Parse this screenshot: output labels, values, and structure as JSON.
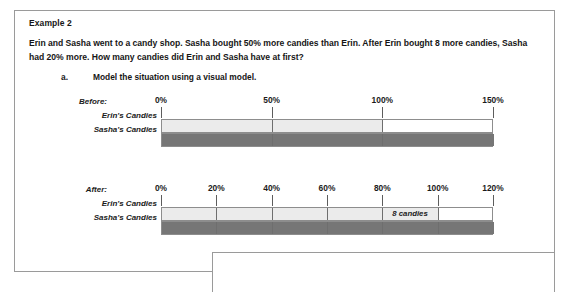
{
  "document": {
    "example_title": "Example 2",
    "problem_statement": "Erin and Sasha went to a candy shop.  Sasha bought 50% more candies than Erin.  After Erin bought 8 more candies, Sasha had 20% more.  How many candies did Erin and Sasha have at first?",
    "part_a": {
      "letter": "a.",
      "text": "Model the situation using a visual model."
    }
  },
  "colors": {
    "panel_border": "#9a9a9a",
    "bar_border": "#8d8d8d",
    "bar_divider": "#6e6e6e",
    "light_fill": "#ebebeb",
    "dark_fill": "#767676",
    "text": "#161616",
    "tick": "#5d5d5d"
  },
  "chart_data": [
    {
      "type": "bar",
      "name": "before-model",
      "title": "Before:",
      "xlabel": "",
      "ylabel": "",
      "orientation": "horizontal",
      "axis_unit": "%",
      "xlim": [
        0,
        150
      ],
      "tick_labels": [
        "0%",
        "50%",
        "100%",
        "150%"
      ],
      "tick_values": [
        0,
        50,
        100,
        150
      ],
      "grid": false,
      "categories": [
        "Erin's Candies",
        "Sasha's Candies"
      ],
      "values": [
        100,
        150
      ],
      "bar_extent": 150,
      "series": [
        {
          "name": "Erin's Candies",
          "value": 100,
          "fill": "light",
          "track_to": 150,
          "dividers": [
            50,
            100
          ]
        },
        {
          "name": "Sasha's Candies",
          "value": 150,
          "fill": "dark",
          "track_to": 150,
          "dividers": [
            50,
            100
          ]
        }
      ]
    },
    {
      "type": "bar",
      "name": "after-model",
      "title": "After:",
      "xlabel": "",
      "ylabel": "",
      "orientation": "horizontal",
      "axis_unit": "%",
      "xlim": [
        0,
        120
      ],
      "tick_labels": [
        "0%",
        "20%",
        "40%",
        "60%",
        "80%",
        "100%",
        "120%"
      ],
      "tick_values": [
        0,
        20,
        40,
        60,
        80,
        100,
        120
      ],
      "grid": false,
      "categories": [
        "Erin's Candies",
        "Sasha's Candies"
      ],
      "values": [
        100,
        120
      ],
      "bar_extent": 120,
      "annotation": {
        "text": "8 candies",
        "from": 80,
        "to": 100
      },
      "series": [
        {
          "name": "Erin's Candies",
          "value": 100,
          "fill": "light",
          "track_to": 120,
          "dividers": [
            20,
            40,
            60,
            80,
            100
          ]
        },
        {
          "name": "Sasha's Candies",
          "value": 120,
          "fill": "dark",
          "track_to": 120,
          "dividers": [
            20,
            40,
            60,
            80,
            100
          ]
        }
      ]
    }
  ]
}
